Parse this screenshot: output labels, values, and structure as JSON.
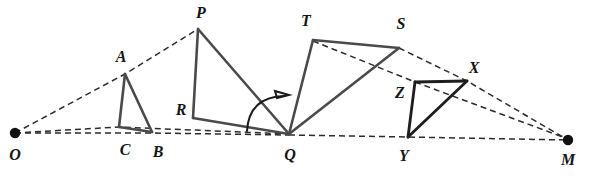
{
  "figure": {
    "width": 590,
    "height": 178,
    "background": "#ffffff",
    "stroke_solid": "#4a4a4a",
    "stroke_solid_dark": "#1e1e1e",
    "stroke_dashed": "#2b2b2b",
    "dot_color": "#111111"
  },
  "labels": {
    "O": "O",
    "A": "A",
    "B": "B",
    "C": "C",
    "P": "P",
    "R": "R",
    "Q": "Q",
    "T": "T",
    "S": "S",
    "X": "X",
    "Y": "Y",
    "Z": "Z",
    "M": "M"
  },
  "points": {
    "O": {
      "x": 15,
      "y": 133
    },
    "A": {
      "x": 125,
      "y": 74
    },
    "B": {
      "x": 152,
      "y": 132
    },
    "C": {
      "x": 119,
      "y": 127
    },
    "P": {
      "x": 198,
      "y": 29
    },
    "R": {
      "x": 193,
      "y": 118
    },
    "Q": {
      "x": 289,
      "y": 134
    },
    "T": {
      "x": 313,
      "y": 40
    },
    "S": {
      "x": 399,
      "y": 48
    },
    "Z": {
      "x": 415,
      "y": 82
    },
    "X": {
      "x": 467,
      "y": 81
    },
    "Y": {
      "x": 408,
      "y": 137
    },
    "M": {
      "x": 568,
      "y": 140
    }
  },
  "label_positions": {
    "O": {
      "x": 15,
      "y": 155
    },
    "A": {
      "x": 121,
      "y": 57
    },
    "B": {
      "x": 158,
      "y": 152
    },
    "C": {
      "x": 125,
      "y": 150
    },
    "P": {
      "x": 201,
      "y": 13
    },
    "R": {
      "x": 181,
      "y": 110
    },
    "Q": {
      "x": 290,
      "y": 155
    },
    "T": {
      "x": 306,
      "y": 21
    },
    "S": {
      "x": 401,
      "y": 24
    },
    "Z": {
      "x": 400,
      "y": 93
    },
    "X": {
      "x": 474,
      "y": 68
    },
    "Y": {
      "x": 404,
      "y": 156
    },
    "M": {
      "x": 568,
      "y": 160
    }
  },
  "triangles": [
    {
      "name": "triangle-ABC",
      "vertices": [
        "A",
        "C",
        "B"
      ],
      "style": "solid"
    },
    {
      "name": "triangle-PRQ",
      "vertices": [
        "P",
        "R",
        "Q"
      ],
      "style": "solid"
    },
    {
      "name": "triangle-TQS",
      "vertices": [
        "T",
        "Q",
        "S"
      ],
      "style": "solid"
    },
    {
      "name": "triangle-ZYX",
      "vertices": [
        "Z",
        "Y",
        "X"
      ],
      "style": "solid-dark"
    }
  ],
  "dashed_rays": [
    {
      "name": "ray-O-to-P",
      "from": "O",
      "through": [
        "A"
      ],
      "to": "P"
    },
    {
      "name": "ray-O-to-Q-upper",
      "from": "O",
      "through": [
        "C"
      ],
      "to": "Q"
    },
    {
      "name": "ray-O-to-Q-lower",
      "from": "O",
      "through": [
        "B"
      ],
      "to": "Q"
    },
    {
      "name": "ray-S-to-M",
      "from": "S",
      "through": [
        "X"
      ],
      "to": "M"
    },
    {
      "name": "ray-T-to-M",
      "from": "T",
      "through": [
        "Z"
      ],
      "to": "M"
    },
    {
      "name": "ray-Q-to-M",
      "from": "Q",
      "through": [
        "Y"
      ],
      "to": "M"
    }
  ],
  "rotation_arrow": {
    "name": "rotation-arc-at-Q",
    "description": "curved arrow indicating rotation about Q",
    "start": {
      "x": 247,
      "y": 130
    },
    "control": {
      "x": 252,
      "y": 92
    },
    "end": {
      "x": 287,
      "y": 95
    }
  },
  "centers": [
    {
      "name": "center-of-similitude-O",
      "label": "O"
    },
    {
      "name": "center-of-similitude-M",
      "label": "M"
    }
  ]
}
